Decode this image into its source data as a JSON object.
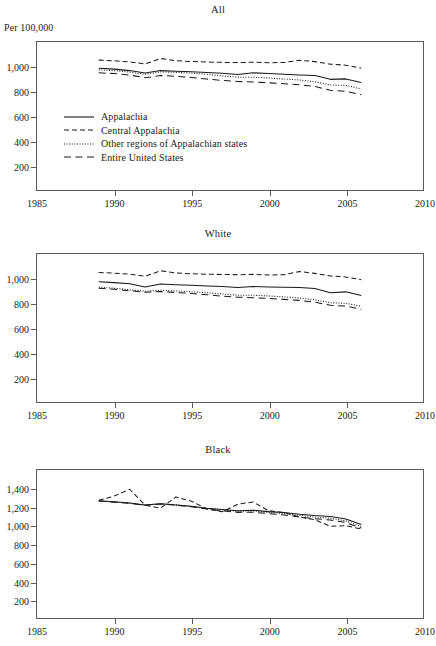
{
  "page": {
    "top_cut_text": "",
    "unit_label": "Per 100,000"
  },
  "legend": {
    "entries": [
      {
        "label": "Appalachia",
        "style": "solid",
        "key": "appalachia"
      },
      {
        "label": "Central Appalachia",
        "style": "dashed",
        "key": "central-appalachia"
      },
      {
        "label": "Other regions of Appalachian states",
        "style": "dotted",
        "key": "other-regions"
      },
      {
        "label": "Entire United States",
        "style": "longdash",
        "key": "entire-united-states"
      }
    ]
  },
  "chart_data": [
    {
      "type": "line",
      "title": "All",
      "xlabel": "",
      "ylabel": "Per 100,000",
      "xlim": [
        1985,
        2010
      ],
      "ylim": [
        0,
        1200
      ],
      "xticks": [
        1985,
        1990,
        1995,
        2000,
        2005,
        2010
      ],
      "xticklabels": [
        "1985",
        "1990",
        "1995",
        "2000",
        "2005",
        "2010"
      ],
      "yticks": [
        200,
        400,
        600,
        800,
        1000
      ],
      "yticklabels": [
        "200",
        "400",
        "600",
        "800",
        "1,000"
      ],
      "grid": false,
      "legend_position": "inside-left",
      "x": [
        1989,
        1990,
        1991,
        1992,
        1993,
        1994,
        1995,
        1996,
        1997,
        1998,
        1999,
        2000,
        2001,
        2002,
        2003,
        2004,
        2005,
        2006
      ],
      "series": [
        {
          "name": "Appalachia",
          "style": "solid",
          "values": [
            988,
            980,
            968,
            948,
            968,
            963,
            958,
            952,
            946,
            936,
            950,
            944,
            938,
            932,
            928,
            897,
            901,
            871
          ]
        },
        {
          "name": "Central Appalachia",
          "style": "dashed",
          "values": [
            1053,
            1048,
            1038,
            1022,
            1066,
            1048,
            1042,
            1038,
            1035,
            1033,
            1036,
            1032,
            1034,
            1052,
            1041,
            1020,
            1012,
            988
          ]
        },
        {
          "name": "Other regions of Appalachian states",
          "style": "dotted",
          "values": [
            974,
            968,
            956,
            938,
            958,
            954,
            948,
            938,
            925,
            915,
            914,
            908,
            900,
            892,
            877,
            852,
            848,
            820
          ]
        },
        {
          "name": "Entire United States",
          "style": "longdash",
          "values": [
            950,
            944,
            932,
            910,
            928,
            922,
            912,
            900,
            888,
            880,
            876,
            869,
            862,
            853,
            840,
            808,
            800,
            772
          ]
        }
      ]
    },
    {
      "type": "line",
      "title": "White",
      "xlabel": "",
      "ylabel": "",
      "xlim": [
        1985,
        2010
      ],
      "ylim": [
        0,
        1200
      ],
      "xticks": [
        1985,
        1990,
        1995,
        2000,
        2005,
        2010
      ],
      "xticklabels": [
        "1985",
        "1990",
        "1995",
        "2000",
        "2005",
        "2010"
      ],
      "yticks": [
        200,
        400,
        600,
        800,
        1000
      ],
      "yticklabels": [
        "200",
        "400",
        "600",
        "800",
        "1,000"
      ],
      "grid": false,
      "legend_position": "none",
      "x": [
        1989,
        1990,
        1991,
        1992,
        1993,
        1994,
        1995,
        1996,
        1997,
        1998,
        1999,
        2000,
        2001,
        2002,
        2003,
        2004,
        2005,
        2006
      ],
      "series": [
        {
          "name": "Appalachia",
          "style": "solid",
          "values": [
            975,
            968,
            958,
            932,
            956,
            950,
            946,
            940,
            936,
            928,
            936,
            932,
            930,
            928,
            920,
            886,
            893,
            863
          ]
        },
        {
          "name": "Central Appalachia",
          "style": "dashed",
          "values": [
            1050,
            1045,
            1036,
            1020,
            1064,
            1046,
            1040,
            1036,
            1034,
            1032,
            1035,
            1030,
            1032,
            1058,
            1043,
            1022,
            1014,
            992
          ]
        },
        {
          "name": "Other regions of Appalachian states",
          "style": "dotted",
          "values": [
            932,
            922,
            910,
            898,
            906,
            900,
            894,
            886,
            876,
            866,
            866,
            860,
            852,
            843,
            828,
            805,
            800,
            776
          ]
        },
        {
          "name": "Entire United States",
          "style": "longdash",
          "values": [
            922,
            914,
            902,
            890,
            896,
            888,
            880,
            870,
            858,
            850,
            846,
            840,
            832,
            824,
            810,
            784,
            778,
            752
          ]
        }
      ]
    },
    {
      "type": "line",
      "title": "Black",
      "xlabel": "",
      "ylabel": "",
      "xlim": [
        1985,
        2010
      ],
      "ylim": [
        0,
        1600
      ],
      "xticks": [
        1985,
        1990,
        1995,
        2000,
        2005,
        2010
      ],
      "xticklabels": [
        "1985",
        "1990",
        "1995",
        "2000",
        "2005",
        "2010"
      ],
      "yticks": [
        200,
        400,
        600,
        800,
        1000,
        1200,
        1400
      ],
      "yticklabels": [
        "200",
        "400",
        "600",
        "800",
        "1,000",
        "1,200",
        "1,400"
      ],
      "grid": false,
      "legend_position": "none",
      "x": [
        1989,
        1990,
        1991,
        1992,
        1993,
        1994,
        1995,
        1996,
        1997,
        1998,
        1999,
        2000,
        2001,
        2002,
        2003,
        2004,
        2005,
        2006
      ],
      "series": [
        {
          "name": "Appalachia",
          "style": "solid",
          "values": [
            1268,
            1256,
            1244,
            1222,
            1234,
            1222,
            1208,
            1186,
            1172,
            1160,
            1166,
            1150,
            1140,
            1122,
            1108,
            1098,
            1070,
            1010
          ]
        },
        {
          "name": "Central Appalachia",
          "style": "dashed",
          "values": [
            1272,
            1318,
            1392,
            1220,
            1188,
            1308,
            1262,
            1180,
            1148,
            1230,
            1254,
            1160,
            1140,
            1092,
            1062,
            992,
            998,
            962
          ]
        },
        {
          "name": "Other regions of Appalachian states",
          "style": "dotted",
          "values": [
            1262,
            1254,
            1242,
            1220,
            1236,
            1224,
            1206,
            1182,
            1168,
            1154,
            1158,
            1142,
            1130,
            1110,
            1092,
            1078,
            1050,
            988
          ]
        },
        {
          "name": "Entire United States",
          "style": "longdash",
          "values": [
            1264,
            1252,
            1240,
            1218,
            1232,
            1220,
            1202,
            1178,
            1160,
            1142,
            1144,
            1128,
            1114,
            1092,
            1072,
            1060,
            1032,
            972
          ]
        }
      ]
    }
  ]
}
